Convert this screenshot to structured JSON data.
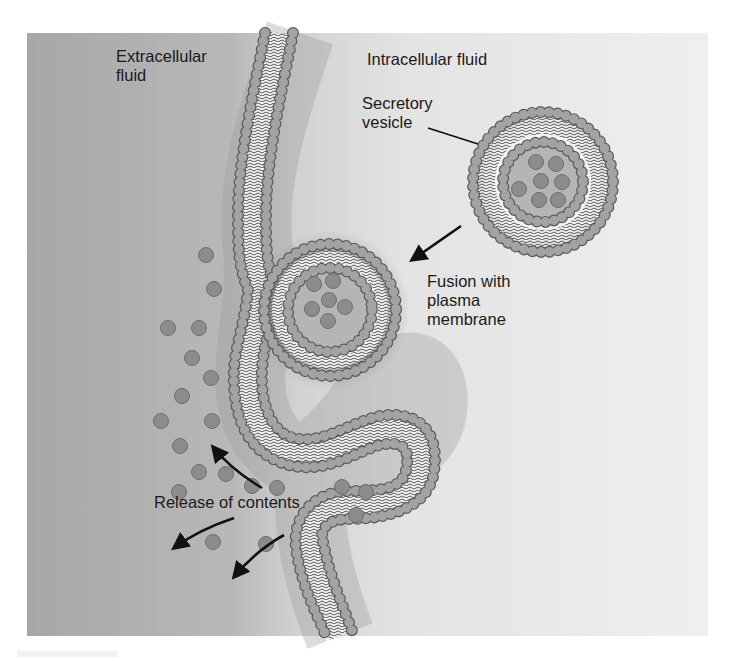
{
  "figure": {
    "type": "biology-illustration",
    "colors": {
      "extracellular_bg": "#a9a9a9",
      "intracellular_bg": "#ececec",
      "phospholipid_head": "#a0a0a0",
      "phospholipid_head_stroke": "#5a5a5a",
      "lipid_tail": "#555555",
      "bilayer_core": "#f4f4f4",
      "vesicle_lumen": "#b4b4b4",
      "content_particle": "#8c8c8c",
      "arrow": "#111111"
    }
  },
  "labels": {
    "extracellular": "Extracellular\nfluid",
    "intracellular": "Intracellular fluid",
    "secretory_vesicle": "Secretory\nvesicle",
    "fusion": "Fusion with\nplasma\nmembrane",
    "release": "Release of contents"
  },
  "stages": [
    {
      "name": "Secretory vesicle",
      "description": "free vesicle in intracellular fluid"
    },
    {
      "name": "Fusion with plasma membrane",
      "description": "vesicle docked and fusing with membrane"
    },
    {
      "name": "Release of contents",
      "description": "vesicle opened, contents released to extracellular fluid"
    }
  ]
}
